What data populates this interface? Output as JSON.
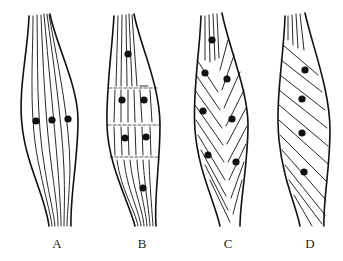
{
  "figure": {
    "colors": {
      "ink": "#111111",
      "background": "#ffffff"
    },
    "panels": [
      {
        "id": "A",
        "label": "A",
        "label_x": 57,
        "arrangement": "parallel",
        "dot_count": 3,
        "dots": [
          [
            36,
            121
          ],
          [
            52,
            120
          ],
          [
            68,
            119
          ]
        ]
      },
      {
        "id": "B",
        "label": "B",
        "label_x": 142,
        "arrangement": "parallel-segmented",
        "dot_count": 6,
        "dots": [
          [
            128,
            54
          ],
          [
            122,
            100
          ],
          [
            144,
            100
          ],
          [
            125,
            138
          ],
          [
            146,
            137
          ],
          [
            143,
            188
          ]
        ]
      },
      {
        "id": "C",
        "label": "C",
        "label_x": 228,
        "arrangement": "bipennate",
        "dot_count": 7,
        "dots": [
          [
            212,
            40
          ],
          [
            205,
            73
          ],
          [
            227,
            79
          ],
          [
            203,
            111
          ],
          [
            232,
            119
          ],
          [
            208,
            155
          ],
          [
            236,
            162
          ]
        ]
      },
      {
        "id": "D",
        "label": "D",
        "label_x": 310,
        "arrangement": "unipennate",
        "dot_count": 4,
        "dots": [
          [
            305,
            70
          ],
          [
            302,
            99
          ],
          [
            302,
            133
          ],
          [
            304,
            172
          ]
        ]
      }
    ]
  }
}
